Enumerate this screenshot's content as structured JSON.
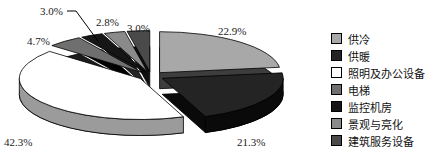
{
  "chart_data": {
    "type": "pie",
    "style": "3d-exploded",
    "title": "",
    "unit": "%",
    "start_angle_deg": 0,
    "direction": "clockwise",
    "legend_position": "right",
    "slices": [
      {
        "name": "供冷",
        "value": 22.9,
        "label": "22.9%",
        "color": "#a8a8a8",
        "side_color": "#3d3d3d"
      },
      {
        "name": "供暖",
        "value": 21.3,
        "label": "21.3%",
        "color": "#242424",
        "side_color": "#0a0a0a"
      },
      {
        "name": "照明及办公设备",
        "value": 42.3,
        "label": "42.3%",
        "color": "#ffffff",
        "side_color": "#9b9b9b"
      },
      {
        "name": "电梯",
        "value": 4.7,
        "label": "4.7%",
        "color": "#6f6f6f",
        "side_color": "#1c1c1c"
      },
      {
        "name": "监控机房",
        "value": 3.0,
        "label": "3.0%",
        "color": "#161616",
        "side_color": "#000000"
      },
      {
        "name": "景观与亮化",
        "value": 2.8,
        "label": "2.8%",
        "color": "#8a8a8a",
        "side_color": "#242424"
      },
      {
        "name": "建筑服务设备",
        "value": 3.0,
        "label": "3.0%",
        "color": "#4a4a4a",
        "side_color": "#101010"
      }
    ]
  }
}
